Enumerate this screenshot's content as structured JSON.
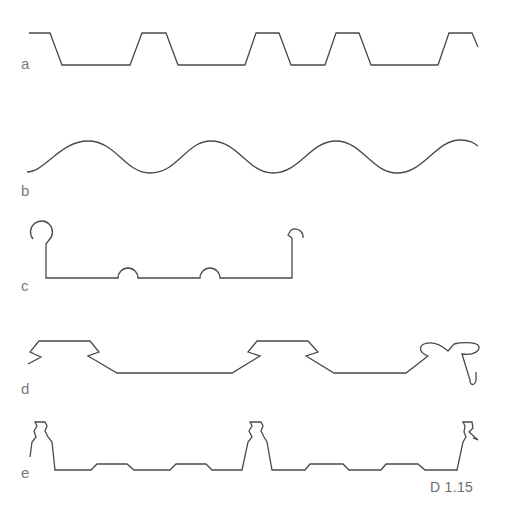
{
  "figure": {
    "caption": "D 1.15",
    "profiles": [
      {
        "id": "a",
        "label": "a",
        "shape": "trapezoidal-profiled-sheet"
      },
      {
        "id": "b",
        "label": "b",
        "shape": "sinusoidal-corrugated-sheet"
      },
      {
        "id": "c",
        "label": "c",
        "shape": "standing-seam-roll-profile"
      },
      {
        "id": "d",
        "label": "d",
        "shape": "dovetail-snap-profile"
      },
      {
        "id": "e",
        "label": "e",
        "shape": "standing-seam-ribbed-profile"
      }
    ],
    "colors": {
      "line": "#4a4a4a",
      "label": "#7a7a7a",
      "background": "#ffffff"
    }
  }
}
